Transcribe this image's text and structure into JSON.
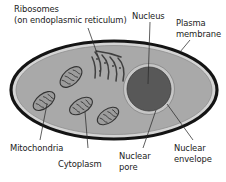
{
  "figure": {
    "type": "biological-cell-diagram",
    "background_color": "#ffffff"
  },
  "colors": {
    "plasma_membrane": "#1a1a1a",
    "membrane_inner_band": "#d9d9d9",
    "cytoplasm": "#a8a8a8",
    "nucleus_fill": "#5a5a5a",
    "nuclear_envelope": "#c9c9c9",
    "mitochondria_fill": "#9a9a9a",
    "mitochondria_stroke": "#3a3a3a",
    "er_stroke": "#3f3f3f",
    "leader_line": "#2b2b2b",
    "label_text": "#1a1a1a"
  },
  "labels": {
    "ribosomes": {
      "line1": "Ribosomes",
      "line2": "(on endoplasmic reticulum)"
    },
    "nucleus": "Nucleus",
    "plasma_membrane": {
      "line1": "Plasma",
      "line2": "membrane"
    },
    "mitochondria": "Mitochondria",
    "cytoplasm": "Cytoplasm",
    "nuclear_pore": {
      "line1": "Nuclear",
      "line2": "pore"
    },
    "nuclear_envelope": {
      "line1": "Nuclear",
      "line2": "envelope"
    }
  },
  "structures": {
    "cell": {
      "cx": 114,
      "cy": 90,
      "rx": 104,
      "ry": 50
    },
    "nucleus": {
      "cx": 149,
      "cy": 89,
      "r": 25
    },
    "mitochondria_count": 4,
    "er_arc_count": 5
  }
}
